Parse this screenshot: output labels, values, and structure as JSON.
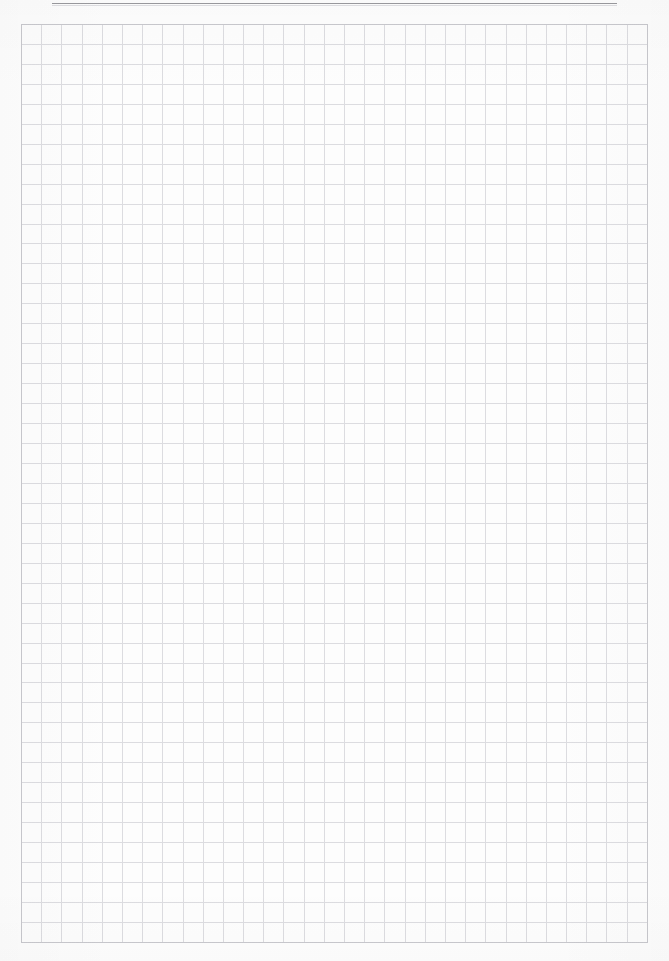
{
  "page": {
    "width": 669,
    "height": 961,
    "background_color": "#fdfdfd",
    "kind": "scanned-document-page"
  },
  "header": {
    "running_text": "",
    "rule_color": "#9a9a9e",
    "note": "header line of text is clipped off the top edge of the page; only descenders are visible"
  },
  "grid": {
    "label": "blank ruled grid / graph-paper table",
    "columns": 31,
    "rows": 46,
    "cell_width_px": 20,
    "cell_height_px": 20,
    "line_color": "#dcdce0",
    "frame_color": "#c8c8cd",
    "cells_are_empty": true,
    "left_px": 21,
    "top_px": 24,
    "width_px": 627,
    "height_px": 919
  },
  "footer": {
    "ghost_text": "",
    "ghost_color": "#f2f2f5",
    "note": "faint ink bleed-through from the reverse side of the sheet; illegible"
  }
}
